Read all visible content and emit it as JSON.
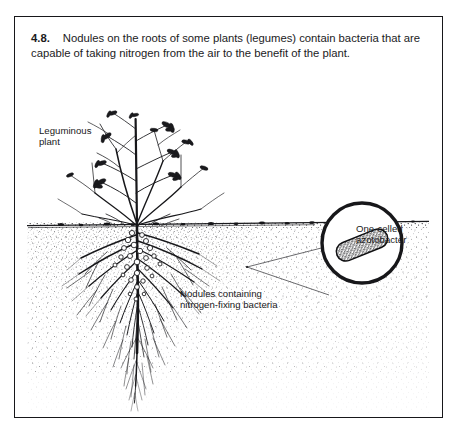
{
  "figure": {
    "number": "4.8.",
    "caption": "Nodules on the roots of some plants (legumes) contain bacteria that are capable of taking nitrogen from the air to the benefit of the plant.",
    "labels": {
      "leguminous_plant": "Leguminous\nplant",
      "azotobacter": "One-celled\nazotobacter",
      "nodules": "Nodules containing\nnitrogen-fixing bacteria"
    },
    "colors": {
      "ink": "#17171a",
      "paper": "#ffffff",
      "soil_stipple": "#2a2a2e"
    },
    "elements": {
      "plant_name": "leguminous-plant-drawing",
      "soil_line_name": "soil-surface-line",
      "root_system_name": "root-system-drawing",
      "nodule_cluster_name": "root-nodule-cluster",
      "magnifier_name": "magnification-circle",
      "bacterium_name": "azotobacter-cell"
    }
  }
}
